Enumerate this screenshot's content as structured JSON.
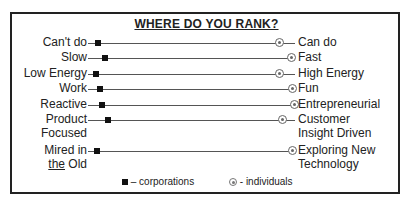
{
  "title": "WHERE DO YOU RANK?",
  "rows": [
    {
      "left": "Can't do",
      "right": "Can do",
      "y": 43,
      "corp_x": 98,
      "ind_x": 280
    },
    {
      "left": "Slow",
      "right": "Fast",
      "y": 58,
      "corp_x": 105,
      "ind_x": 292
    },
    {
      "left": "Low Energy",
      "right": "High Energy",
      "y": 74,
      "corp_x": 96,
      "ind_x": 280
    },
    {
      "left": "Work",
      "right": "Fun",
      "y": 89,
      "corp_x": 100,
      "ind_x": 293
    },
    {
      "left": "Reactive",
      "right": "Entrepreneurial",
      "y": 105,
      "corp_x": 102,
      "ind_x": 295
    },
    {
      "left": "Product",
      "left2": "Focused",
      "right": "Customer",
      "right2": "Insight Driven",
      "y": 120,
      "corp_x": 108,
      "ind_x": 283
    },
    {
      "left": "Mired in",
      "left2_u": "the",
      "left2": " Old",
      "right": "Exploring New",
      "right2": "Technology",
      "y": 151,
      "corp_x": 97,
      "ind_x": 293
    }
  ],
  "legend": {
    "corporations": "– corporations",
    "individuals": "- individuals"
  }
}
